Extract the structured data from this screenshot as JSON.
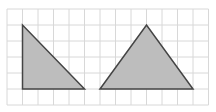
{
  "figure": {
    "grid": {
      "x0": 7,
      "y0": 9,
      "cols": 13,
      "rows": 6,
      "cell_w": 15.5,
      "cell_h": 16,
      "color": "#d8d8d8"
    },
    "shapes": [
      {
        "name": "right-triangle",
        "points": [
          [
            1,
            1
          ],
          [
            1,
            5
          ],
          [
            5,
            5
          ]
        ],
        "fill": "#bdbdbd",
        "stroke": "#444444"
      },
      {
        "name": "isosceles-triangle",
        "points": [
          [
            6,
            5
          ],
          [
            9,
            1
          ],
          [
            12,
            5
          ]
        ],
        "fill": "#bdbdbd",
        "stroke": "#444444"
      }
    ]
  }
}
